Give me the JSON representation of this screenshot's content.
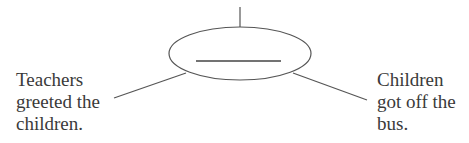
{
  "diagram": {
    "type": "cause-effect-web",
    "center_node": {
      "label": "",
      "blank": true,
      "shape": "ellipse"
    },
    "top_connector": {
      "label": ""
    },
    "left_node": {
      "lines": [
        "Teachers",
        "greeted the",
        "children."
      ]
    },
    "right_node": {
      "lines": [
        "Children",
        "got off the",
        "bus."
      ]
    },
    "colors": {
      "stroke": "#555555",
      "text": "#3a3a3a",
      "background": "#ffffff"
    }
  }
}
